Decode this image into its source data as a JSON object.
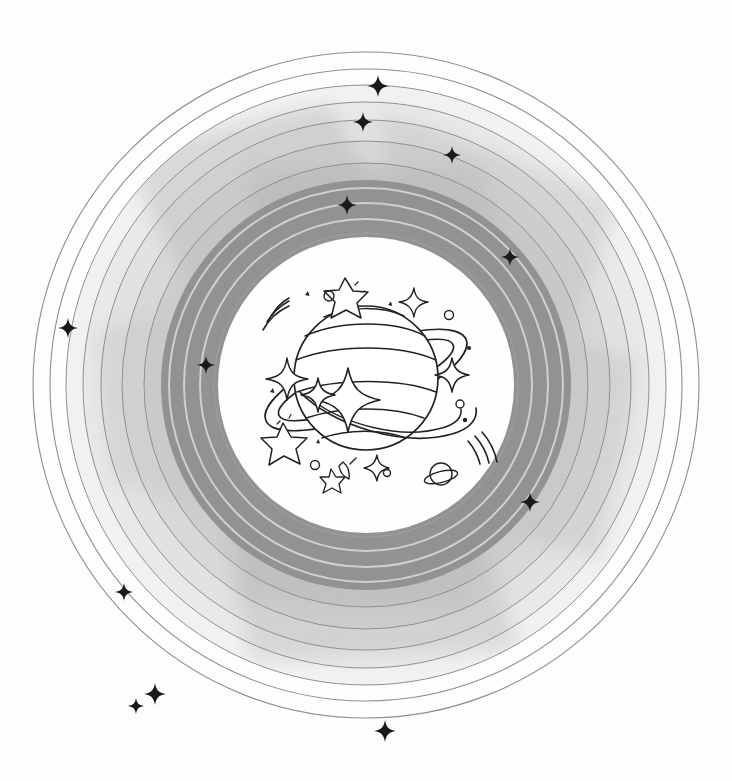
{
  "artwork": {
    "title": "Saturn with Concentric Orbital Rings",
    "subject": "saturn-planet",
    "style": "line-art-watercolor",
    "canvas": {
      "width": 732,
      "height": 781,
      "background": "#fdfdfd"
    },
    "center": {
      "x": 366,
      "y": 385
    }
  },
  "palette": {
    "background": "#fdfdfd",
    "paper": "#fcfcfb",
    "ring_outline": "#7d7d7d",
    "ring_light_1": "#f0f0ef",
    "ring_light_2": "#e6e6e5",
    "ring_light_3": "#dcdcdb",
    "ring_mid_1": "#d2d2d1",
    "ring_mid_2": "#c6c6c5",
    "ring_dark": "#8c8c8c",
    "ring_dark_edge": "#9a9a9a",
    "inner_disc": "#fefefe",
    "ink": "#1a1a1a",
    "star_fill": "#111111",
    "wash_overlay": "#b8b8b8"
  },
  "rings": [
    {
      "name": "outline-ring-outer-1",
      "radius": 333,
      "type": "stroke",
      "stroke": "#8a8a8a",
      "width": 1.1
    },
    {
      "name": "outline-ring-outer-2",
      "radius": 316,
      "type": "stroke",
      "stroke": "#8a8a8a",
      "width": 1.1
    },
    {
      "name": "light-band-1",
      "radius": 300,
      "type": "fill",
      "fill": "#f1f1f0"
    },
    {
      "name": "outline-ring-3",
      "radius": 300,
      "type": "stroke",
      "stroke": "#8a8a8a",
      "width": 1.0
    },
    {
      "name": "light-band-2",
      "radius": 283,
      "type": "fill",
      "fill": "#e9e9e8"
    },
    {
      "name": "outline-ring-4",
      "radius": 283,
      "type": "stroke",
      "stroke": "#8a8a8a",
      "width": 1.0
    },
    {
      "name": "light-band-3",
      "radius": 265,
      "type": "fill",
      "fill": "#e1e1e0"
    },
    {
      "name": "outline-ring-5",
      "radius": 265,
      "type": "stroke",
      "stroke": "#8a8a8a",
      "width": 1.0
    },
    {
      "name": "mid-band-1",
      "radius": 244,
      "type": "fill",
      "fill": "#d7d7d6"
    },
    {
      "name": "outline-ring-6",
      "radius": 244,
      "type": "stroke",
      "stroke": "#8a8a8a",
      "width": 1.0
    },
    {
      "name": "mid-band-2",
      "radius": 222,
      "type": "fill",
      "fill": "#cdcdcc"
    },
    {
      "name": "outline-ring-7",
      "radius": 222,
      "type": "stroke",
      "stroke": "#8a8a8a",
      "width": 1.0
    },
    {
      "name": "dark-band-1",
      "radius": 205,
      "type": "fill",
      "fill": "#8e8e8e"
    },
    {
      "name": "dark-separator-1",
      "radius": 197,
      "type": "stroke",
      "stroke": "#cfcfcf",
      "width": 2.0
    },
    {
      "name": "dark-band-2",
      "radius": 190,
      "type": "fill",
      "fill": "#8c8c8c"
    },
    {
      "name": "dark-separator-2",
      "radius": 182,
      "type": "stroke",
      "stroke": "#cfcfcf",
      "width": 2.0
    },
    {
      "name": "dark-band-3",
      "radius": 175,
      "type": "fill",
      "fill": "#8a8a8a"
    },
    {
      "name": "dark-separator-3",
      "radius": 166,
      "type": "stroke",
      "stroke": "#cfcfcf",
      "width": 2.0
    },
    {
      "name": "dark-band-4",
      "radius": 158,
      "type": "fill",
      "fill": "#8c8c8c"
    },
    {
      "name": "inner-disc",
      "radius": 148,
      "type": "fill",
      "fill": "#fefefe"
    }
  ],
  "stars": [
    {
      "name": "star-top-1",
      "x": 378,
      "y": 86,
      "size": 11
    },
    {
      "name": "star-top-2",
      "x": 363,
      "y": 122,
      "size": 10
    },
    {
      "name": "star-top-right-1",
      "x": 452,
      "y": 155,
      "size": 9
    },
    {
      "name": "star-upper-left",
      "x": 347,
      "y": 205,
      "size": 10
    },
    {
      "name": "star-right-upper",
      "x": 510,
      "y": 257,
      "size": 9
    },
    {
      "name": "star-left-outer",
      "x": 68,
      "y": 328,
      "size": 10
    },
    {
      "name": "star-left-mid",
      "x": 206,
      "y": 365,
      "size": 9
    },
    {
      "name": "star-right-lower",
      "x": 530,
      "y": 502,
      "size": 10
    },
    {
      "name": "star-left-lower",
      "x": 124,
      "y": 592,
      "size": 9
    },
    {
      "name": "star-bottom-left-1",
      "x": 155,
      "y": 694,
      "size": 11
    },
    {
      "name": "star-bottom-left-2",
      "x": 136,
      "y": 706,
      "size": 8
    },
    {
      "name": "star-bottom-center",
      "x": 385,
      "y": 731,
      "size": 11
    }
  ],
  "inner_scene": {
    "name": "saturn-doodle-scene",
    "planet": {
      "name": "saturn-planet",
      "cx": 366,
      "cy": 380,
      "radius": 72
    },
    "elements": [
      {
        "name": "planet-body-bands",
        "count": 6,
        "label": "horizontal cloud bands"
      },
      {
        "name": "planet-ring-ellipse",
        "label": "tilted ring around planet"
      },
      {
        "name": "motion-lines-upper-left",
        "count": 3
      },
      {
        "name": "motion-lines-lower-right",
        "count": 3
      },
      {
        "name": "sparkle-4point-large",
        "count": 2
      },
      {
        "name": "sparkle-4point-small",
        "count": 4
      },
      {
        "name": "outline-star-5point",
        "count": 3
      },
      {
        "name": "small-circle-dot",
        "count": 5
      },
      {
        "name": "tiny-planet-with-ring",
        "count": 1
      },
      {
        "name": "shooting-star",
        "count": 1
      },
      {
        "name": "ink-speck",
        "count": 6
      }
    ]
  }
}
